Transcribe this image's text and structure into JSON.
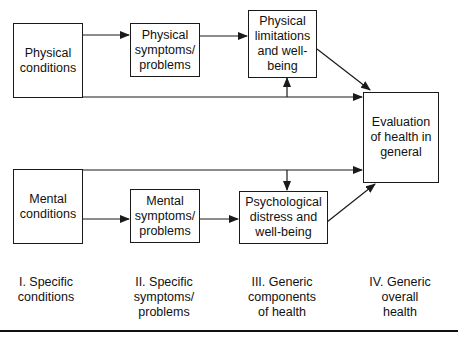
{
  "boxes": {
    "physical_conditions": "Physical\nconditions",
    "physical_symptoms": "Physical\nsymptoms/\nproblems",
    "physical_limitations": "Physical\nlimitations\nand well-\nbeing",
    "evaluation": "Evaluation\nof health in\ngeneral",
    "mental_conditions": "Mental\nconditions",
    "mental_symptoms": "Mental\nsymptoms/\nproblems",
    "psychological_distress": "Psychological\ndistress and\nwell-being"
  },
  "levels": [
    {
      "label": "I. Specific\nconditions"
    },
    {
      "label": "II. Specific\nsymptoms/\nproblems"
    },
    {
      "label": "III. Generic\ncomponents\nof health"
    },
    {
      "label": "IV. Generic\noverall\nhealth"
    }
  ],
  "colors": {
    "line": "#1a1a1a",
    "background": "#ffffff"
  }
}
